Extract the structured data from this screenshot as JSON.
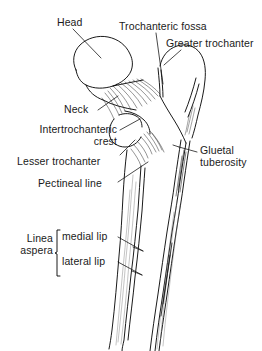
{
  "figure": {
    "line_color": "#000000",
    "background_color": "#ffffff",
    "labels": {
      "head": "Head",
      "trochanteric_fossa": "Trochanteric fossa",
      "greater_trochanter": "Greater trochanter",
      "neck": "Neck",
      "intertrochanteric_crest_line1": "Intertrochanteric",
      "intertrochanteric_crest_line2": "crest",
      "lesser_trochanter": "Lesser trochanter",
      "pectineal_line": "Pectineal line",
      "gluteal_tuberosity_line1": "Gluetal",
      "gluteal_tuberosity_line2": "tuberosity",
      "linea_line1": "Linea",
      "linea_line2": "aspera",
      "medial_lip": "medial lip",
      "lateral_lip": "lateral lip"
    }
  }
}
